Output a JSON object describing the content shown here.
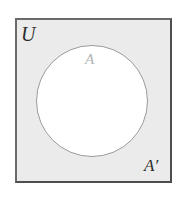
{
  "figure": {
    "type": "venn-diagram",
    "canvas": {
      "width": 185,
      "height": 197,
      "background_color": "#ffffff"
    },
    "universe": {
      "label": "U",
      "shape": "rectangle",
      "x": 15,
      "y": 18,
      "width": 157,
      "height": 165,
      "fill_color": "#ebebeb",
      "border_color": "#5a5a5a",
      "border_width": 2
    },
    "set": {
      "label": "A",
      "shape": "circle",
      "center_x": 92,
      "center_y": 101,
      "radius": 56,
      "fill_color": "#ffffff",
      "border_color": "#9a9a9a",
      "border_width": 1.4,
      "label_color": "#b3b3b3"
    },
    "complement": {
      "label": "A",
      "prime": "′",
      "region": "shaded area inside rectangle outside circle",
      "fill_color": "#ebebeb",
      "label_color": "#2b2b2b"
    },
    "labels": {
      "universe": "U",
      "set_a": "A",
      "complement_base": "A",
      "complement_prime": "′"
    }
  }
}
